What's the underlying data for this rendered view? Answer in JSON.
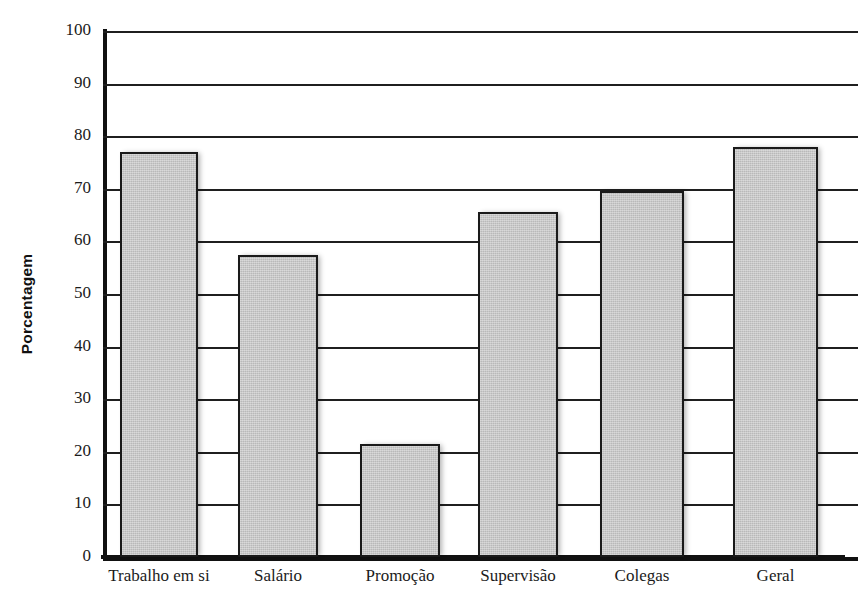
{
  "chart_data": {
    "type": "bar",
    "title": "",
    "xlabel": "",
    "ylabel": "Porcentagem",
    "ylim": [
      0,
      100
    ],
    "ytick_step": 10,
    "grid": true,
    "legend": "none",
    "bar_fill_color": "#b9b9b9",
    "bar_border_color": "#1a1a1a",
    "axis_color": "#111111",
    "categories": [
      "Trabalho em si",
      "Salário",
      "Promoção",
      "Supervisão",
      "Colegas",
      "Geral"
    ],
    "values": [
      77,
      57.5,
      21.5,
      65.5,
      69.5,
      78
    ],
    "yticks": [
      "0",
      "10",
      "20",
      "30",
      "40",
      "50",
      "60",
      "70",
      "80",
      "90",
      "100"
    ]
  }
}
